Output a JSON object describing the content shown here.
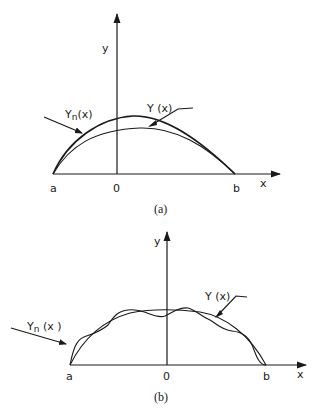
{
  "panels": [
    {
      "id": "a",
      "caption": "(a)",
      "y_axis_label": "y",
      "x_axis_label": "x",
      "ticks": {
        "left": "a",
        "origin": "0",
        "right": "b"
      },
      "curves": [
        {
          "name": "Yn(x)",
          "label_main": "Y",
          "label_sub": "n",
          "label_rest": "(x)",
          "description": "approximation, higher arch"
        },
        {
          "name": "Y(x)",
          "label": "Y (x)",
          "description": "exact solution, lower arch"
        }
      ]
    },
    {
      "id": "b",
      "caption": "(b)",
      "y_axis_label": "y",
      "x_axis_label": "x",
      "ticks": {
        "left": "a",
        "origin": "0",
        "right": "b"
      },
      "curves": [
        {
          "name": "Yn(x)",
          "label_main": "Y",
          "label_sub": "n",
          "label_rest": " (x )",
          "description": "oscillating approximation"
        },
        {
          "name": "Y(x)",
          "label": "Y (x)",
          "description": "smooth plateau curve"
        }
      ]
    }
  ]
}
